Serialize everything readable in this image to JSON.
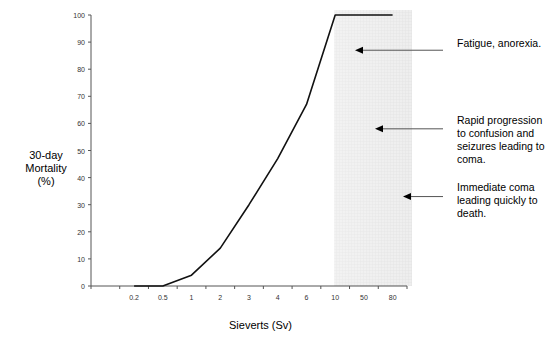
{
  "chart_data": {
    "type": "line",
    "title": "",
    "xlabel": "Sieverts (Sv)",
    "ylabel": "30-day\nMortality\n(%)",
    "categories": [
      "",
      "0.2",
      "0.5",
      "1",
      "2",
      "3",
      "4",
      "6",
      "10",
      "50",
      "80"
    ],
    "series": [
      {
        "name": "30-day Mortality",
        "values": [
          null,
          0,
          0,
          4,
          14,
          30,
          47,
          67,
          100,
          100,
          100
        ]
      }
    ],
    "yticks": [
      0,
      10,
      20,
      30,
      40,
      50,
      60,
      70,
      80,
      90,
      100
    ],
    "ylim": [
      0,
      100
    ],
    "grid": false,
    "legend": "none",
    "shaded_region": {
      "from_category": "10",
      "to_category": "80",
      "color": "#e6e6e6"
    },
    "annotations": [
      {
        "text": "Fatigue, anorexia.",
        "arrow_y_value": 87
      },
      {
        "text": "Rapid progression\nto confusion and\nseizures leading to\ncoma.",
        "arrow_y_value": 58
      },
      {
        "text": "Immediate coma\nleading quickly to\ndeath.",
        "arrow_y_value": 33
      }
    ]
  },
  "colors": {
    "line": "#111111",
    "axis": "#555555",
    "shade": "#e4e4e4",
    "arrow": "#555555"
  }
}
